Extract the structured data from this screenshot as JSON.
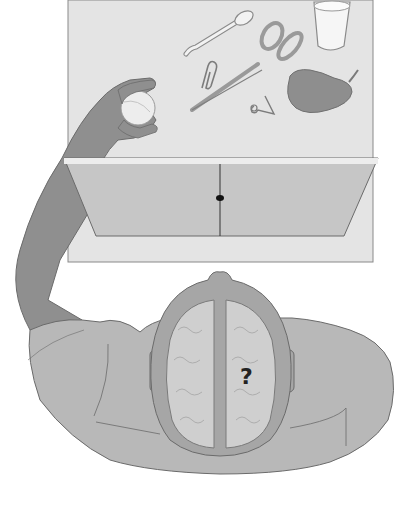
{
  "figure": {
    "annotation": "?",
    "table_objects": [
      "spoon",
      "glass",
      "paper-clip",
      "scissors",
      "safety-pin",
      "pear",
      "ball"
    ],
    "colors": {
      "background": "#ffffff",
      "table": "#e4e4e4",
      "table_border": "#8a8a8a",
      "screen": "#c6c6c6",
      "screen_edge": "#ededed",
      "skin": "#8f8f8f",
      "shirt": "#b8b8b8",
      "brain": "#cfcfcf",
      "skull": "#a6a6a6",
      "outline": "#6b6b6b"
    }
  }
}
